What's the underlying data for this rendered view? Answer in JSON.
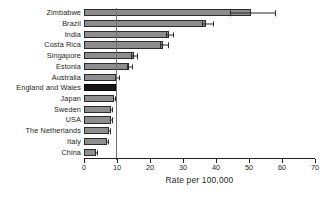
{
  "chart_data": {
    "type": "bar",
    "orientation": "horizontal",
    "title": "",
    "subtitle": "",
    "xlabel": "Rate per 100,000",
    "ylabel": "",
    "xlim": [
      0,
      70
    ],
    "xticks": [
      0,
      10,
      20,
      30,
      40,
      50,
      60,
      70
    ],
    "xtick_labels": [
      "0",
      "10",
      "20",
      "30",
      "40",
      "50",
      "60",
      "70"
    ],
    "grid": false,
    "legend": "none",
    "reference_line": {
      "value": 9.7,
      "label": "England and Wales reference"
    },
    "highlight_category": "England and Wales",
    "colors": {
      "bar_fill": "#8d8d8d",
      "bar_edge": "#2b2b2b",
      "highlight_fill": "#171717",
      "axis": "#231f20",
      "reference_line": "#6f6f6f",
      "background": "#ffffff"
    },
    "categories": [
      "Zimbabwe",
      "Brazil",
      "India",
      "Costa Rica",
      "Singapore",
      "Estonia",
      "Australia",
      "England and Wales",
      "Japan",
      "Sweden",
      "USA",
      "The Netherlands",
      "Italy",
      "China"
    ],
    "values": [
      50.5,
      37.0,
      25.8,
      24.0,
      15.0,
      13.6,
      10.0,
      9.7,
      9.0,
      8.2,
      8.1,
      7.5,
      7.0,
      3.6
    ],
    "error_low": [
      44.2,
      35.8,
      24.8,
      23.0,
      14.2,
      13.0,
      9.4,
      9.7,
      8.8,
      8.0,
      7.9,
      7.3,
      6.8,
      3.4
    ],
    "error_high": [
      57.9,
      39.0,
      27.0,
      25.5,
      16.2,
      14.5,
      10.6,
      9.7,
      9.4,
      8.5,
      8.4,
      7.8,
      7.3,
      3.9
    ],
    "has_error_bars": [
      true,
      true,
      true,
      true,
      true,
      true,
      true,
      false,
      true,
      true,
      true,
      true,
      true,
      true
    ]
  }
}
